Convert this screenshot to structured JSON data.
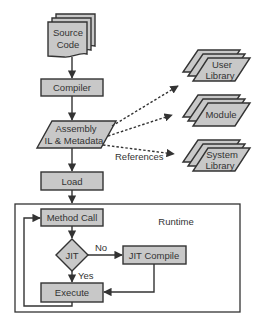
{
  "diagram": {
    "colors": {
      "node_fill": "#c8c8c8",
      "stroke": "#333333",
      "background": "#ffffff"
    },
    "nodes": {
      "source_code": {
        "line1": "Source",
        "line2": "Code",
        "shape": "stacked-document"
      },
      "compiler": {
        "label": "Compiler",
        "shape": "rectangle"
      },
      "assembly": {
        "line1": "Assembly",
        "line2": "IL & Metadata",
        "shape": "parallelogram"
      },
      "load": {
        "label": "Load",
        "shape": "rectangle"
      },
      "method_call": {
        "label": "Method Call",
        "shape": "rectangle"
      },
      "jit": {
        "label": "JIT",
        "shape": "diamond"
      },
      "jit_compile": {
        "label": "JIT Compile",
        "shape": "rectangle"
      },
      "execute": {
        "label": "Execute",
        "shape": "rectangle"
      },
      "user_library": {
        "line1": "User",
        "line2": "Library",
        "shape": "stacked-parallelogram"
      },
      "module": {
        "label": "Module",
        "shape": "stacked-parallelogram"
      },
      "system_library": {
        "line1": "System",
        "line2": "Library",
        "shape": "stacked-parallelogram"
      }
    },
    "edge_labels": {
      "references": "References",
      "no": "No",
      "yes": "Yes"
    },
    "groups": {
      "runtime": {
        "label": "Runtime"
      }
    },
    "edges": [
      {
        "from": "source_code",
        "to": "compiler",
        "style": "solid"
      },
      {
        "from": "compiler",
        "to": "assembly",
        "style": "solid"
      },
      {
        "from": "assembly",
        "to": "load",
        "style": "solid"
      },
      {
        "from": "load",
        "to": "method_call",
        "style": "solid"
      },
      {
        "from": "method_call",
        "to": "jit",
        "style": "solid"
      },
      {
        "from": "jit",
        "to": "jit_compile",
        "label": "No",
        "style": "solid"
      },
      {
        "from": "jit",
        "to": "execute",
        "label": "Yes",
        "style": "solid"
      },
      {
        "from": "jit_compile",
        "to": "execute",
        "style": "solid"
      },
      {
        "from": "execute",
        "to": "method_call",
        "style": "solid"
      },
      {
        "from": "assembly",
        "to": "user_library",
        "style": "dotted"
      },
      {
        "from": "assembly",
        "to": "module",
        "style": "dotted"
      },
      {
        "from": "assembly",
        "to": "system_library",
        "label": "References",
        "style": "dotted"
      }
    ]
  }
}
